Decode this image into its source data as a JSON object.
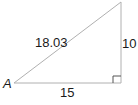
{
  "diagram": {
    "type": "right-triangle",
    "vertex_label": "A",
    "hypotenuse_label": "18.03",
    "opposite_label": "10",
    "adjacent_label": "15",
    "right_angle_marker": true,
    "colors": {
      "line": "#b0b0b0",
      "text": "#1a1a1a"
    }
  }
}
